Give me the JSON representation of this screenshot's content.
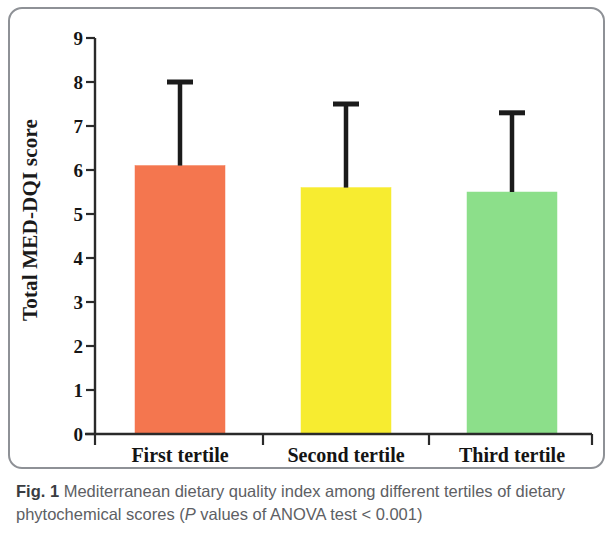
{
  "figure": {
    "caption_label": "Fig. 1",
    "caption_part1": " Mediterranean dietary quality index among different tertiles of dietary phytochemical scores (",
    "caption_italic": "P",
    "caption_part2": " values of ANOVA test < 0.001)"
  },
  "chart_data": {
    "type": "bar",
    "title": "",
    "xlabel": "",
    "ylabel": "Total MED-DQI score",
    "categories": [
      "First tertile",
      "Second tertile",
      "Third tertile"
    ],
    "values": [
      6.1,
      5.6,
      5.5
    ],
    "error_high": [
      8.0,
      7.5,
      7.3
    ],
    "error_low": [
      6.1,
      5.6,
      5.5
    ],
    "colors": [
      "#F4764F",
      "#F7EC30",
      "#8CDF8A"
    ],
    "ylim": [
      0,
      9
    ],
    "ytick_values": [
      0,
      1,
      2,
      3,
      4,
      5,
      6,
      7,
      8,
      9
    ],
    "ytick_labels": [
      "0",
      "1",
      "2",
      "3",
      "4",
      "5",
      "6",
      "7",
      "8",
      "9"
    ],
    "grid": false,
    "legend": "none",
    "axis_color": "#2a2a2a",
    "errorbar_color": "#1b1b1b"
  }
}
